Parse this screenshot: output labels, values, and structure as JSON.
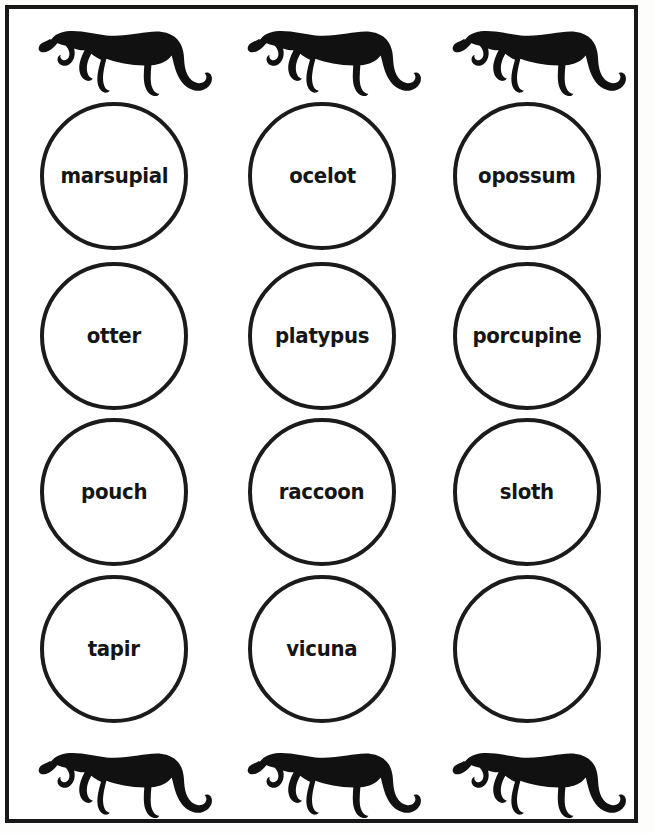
{
  "page": {
    "background_color": "#ffffff",
    "ink_color": "#1b1b1b",
    "border_color": "#181818"
  },
  "decorations": {
    "top_row": [
      {
        "icon": "jaguar-silhouette",
        "label": "jaguar silhouette"
      },
      {
        "icon": "jaguar-silhouette",
        "label": "jaguar silhouette"
      },
      {
        "icon": "jaguar-silhouette",
        "label": "jaguar silhouette"
      }
    ],
    "bottom_row": [
      {
        "icon": "jaguar-silhouette",
        "label": "jaguar silhouette"
      },
      {
        "icon": "jaguar-silhouette",
        "label": "jaguar silhouette"
      },
      {
        "icon": "jaguar-silhouette",
        "label": "jaguar silhouette"
      }
    ]
  },
  "grid": {
    "columns": 3,
    "rows": 4,
    "cells": [
      {
        "row": 1,
        "col": 1,
        "label": "marsupial",
        "empty": false
      },
      {
        "row": 1,
        "col": 2,
        "label": "ocelot",
        "empty": false
      },
      {
        "row": 1,
        "col": 3,
        "label": "opossum",
        "empty": false
      },
      {
        "row": 2,
        "col": 1,
        "label": "otter",
        "empty": false
      },
      {
        "row": 2,
        "col": 2,
        "label": "platypus",
        "empty": false
      },
      {
        "row": 2,
        "col": 3,
        "label": "porcupine",
        "empty": false
      },
      {
        "row": 3,
        "col": 1,
        "label": "pouch",
        "empty": false
      },
      {
        "row": 3,
        "col": 2,
        "label": "raccoon",
        "empty": false
      },
      {
        "row": 3,
        "col": 3,
        "label": "sloth",
        "empty": false
      },
      {
        "row": 4,
        "col": 1,
        "label": "tapir",
        "empty": false
      },
      {
        "row": 4,
        "col": 2,
        "label": "vicuna",
        "empty": false
      },
      {
        "row": 4,
        "col": 3,
        "label": "",
        "empty": true
      }
    ]
  }
}
